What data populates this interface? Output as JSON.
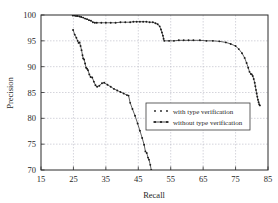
{
  "chart_data": {
    "type": "line",
    "title": "",
    "xlabel": "Recall",
    "ylabel": "Precision",
    "xlim": [
      15,
      85
    ],
    "ylim": [
      70,
      100
    ],
    "xticks": [
      15,
      25,
      35,
      45,
      55,
      65,
      75,
      85
    ],
    "yticks": [
      70,
      75,
      80,
      85,
      90,
      95,
      100
    ],
    "grid": true,
    "legend_position": "center-right",
    "series": [
      {
        "name": "with type verification",
        "marker": "dot",
        "color": "#1a1a1a",
        "points": [
          [
            24.8,
            99.9
          ],
          [
            25.3,
            99.9
          ],
          [
            25.8,
            99.8
          ],
          [
            26.3,
            99.8
          ],
          [
            26.9,
            99.7
          ],
          [
            27.4,
            99.6
          ],
          [
            28.0,
            99.5
          ],
          [
            28.6,
            99.3
          ],
          [
            29.2,
            99.2
          ],
          [
            29.8,
            99.0
          ],
          [
            30.4,
            98.9
          ],
          [
            31.0,
            98.6
          ],
          [
            31.6,
            98.5
          ],
          [
            32.2,
            98.5
          ],
          [
            33.6,
            98.5
          ],
          [
            35.0,
            98.5
          ],
          [
            36.5,
            98.5
          ],
          [
            38.0,
            98.5
          ],
          [
            39.5,
            98.6
          ],
          [
            41.0,
            98.6
          ],
          [
            42.5,
            98.6
          ],
          [
            43.5,
            98.7
          ],
          [
            44.5,
            98.7
          ],
          [
            45.5,
            98.7
          ],
          [
            46.5,
            98.7
          ],
          [
            47.5,
            98.7
          ],
          [
            48.5,
            98.6
          ],
          [
            49.5,
            98.6
          ],
          [
            50.3,
            98.4
          ],
          [
            51.0,
            98.2
          ],
          [
            51.6,
            97.8
          ],
          [
            52.0,
            97.2
          ],
          [
            52.3,
            96.6
          ],
          [
            52.6,
            96.0
          ],
          [
            52.8,
            95.4
          ],
          [
            53.0,
            95.0
          ],
          [
            54.5,
            95.0
          ],
          [
            56.0,
            95.0
          ],
          [
            57.5,
            95.1
          ],
          [
            59.0,
            95.1
          ],
          [
            60.5,
            95.1
          ],
          [
            62.0,
            95.1
          ],
          [
            64.0,
            95.1
          ],
          [
            66.0,
            95.0
          ],
          [
            68.0,
            95.0
          ],
          [
            70.0,
            94.9
          ],
          [
            72.0,
            94.7
          ],
          [
            73.5,
            94.4
          ],
          [
            75.0,
            94.0
          ],
          [
            76.0,
            93.4
          ],
          [
            77.0,
            92.6
          ],
          [
            77.8,
            91.7
          ],
          [
            78.4,
            90.7
          ],
          [
            78.9,
            89.8
          ],
          [
            79.3,
            89.0
          ],
          [
            79.7,
            88.6
          ],
          [
            80.0,
            88.5
          ],
          [
            80.3,
            88.2
          ],
          [
            80.6,
            87.6
          ],
          [
            80.9,
            86.9
          ],
          [
            81.1,
            86.2
          ],
          [
            81.3,
            85.5
          ],
          [
            81.5,
            84.8
          ],
          [
            81.7,
            84.2
          ],
          [
            81.9,
            83.6
          ],
          [
            82.1,
            83.1
          ],
          [
            82.3,
            82.7
          ],
          [
            82.5,
            82.5
          ]
        ]
      },
      {
        "name": "without type verification",
        "marker": "dot",
        "color": "#1a1a1a",
        "points": [
          [
            24.9,
            97.1
          ],
          [
            25.4,
            96.2
          ],
          [
            25.9,
            95.6
          ],
          [
            26.3,
            95.0
          ],
          [
            26.6,
            94.6
          ],
          [
            26.9,
            94.7
          ],
          [
            27.2,
            94.0
          ],
          [
            27.5,
            93.2
          ],
          [
            27.8,
            92.2
          ],
          [
            28.0,
            91.6
          ],
          [
            28.3,
            91.4
          ],
          [
            28.6,
            90.6
          ],
          [
            28.9,
            89.8
          ],
          [
            29.2,
            89.6
          ],
          [
            29.5,
            89.3
          ],
          [
            29.9,
            88.5
          ],
          [
            30.3,
            88.0
          ],
          [
            30.8,
            87.9
          ],
          [
            31.3,
            87.1
          ],
          [
            31.8,
            86.4
          ],
          [
            32.3,
            86.1
          ],
          [
            33.0,
            86.3
          ],
          [
            33.8,
            86.8
          ],
          [
            34.5,
            86.9
          ],
          [
            35.5,
            86.5
          ],
          [
            36.5,
            86.1
          ],
          [
            37.5,
            85.7
          ],
          [
            38.5,
            85.4
          ],
          [
            39.5,
            85.1
          ],
          [
            40.5,
            84.8
          ],
          [
            41.5,
            84.5
          ],
          [
            42.0,
            84.4
          ],
          [
            42.5,
            83.0
          ],
          [
            43.2,
            81.8
          ],
          [
            44.0,
            80.5
          ],
          [
            44.8,
            79.0
          ],
          [
            45.5,
            77.6
          ],
          [
            46.2,
            76.2
          ],
          [
            46.8,
            74.9
          ],
          [
            47.2,
            73.6
          ],
          [
            47.6,
            73.3
          ],
          [
            48.0,
            72.4
          ],
          [
            48.3,
            72.0
          ],
          [
            48.7,
            71.0
          ],
          [
            49.0,
            70.0
          ]
        ]
      }
    ]
  },
  "legend": {
    "entries": [
      {
        "label": "with type verification",
        "style": "dots"
      },
      {
        "label": "without type verification",
        "style": "line-dots"
      }
    ]
  },
  "axes": {
    "x": {
      "title": "Recall",
      "ticks": [
        "15",
        "25",
        "35",
        "45",
        "55",
        "65",
        "75",
        "85"
      ]
    },
    "y": {
      "title": "Precision",
      "ticks": [
        "70",
        "75",
        "80",
        "85",
        "90",
        "95",
        "100"
      ]
    }
  },
  "colors": {
    "plot_border": "#2b2b2b",
    "grid": "#b9b9c4",
    "series": "#1a1a1a",
    "background": "#ffffff"
  }
}
